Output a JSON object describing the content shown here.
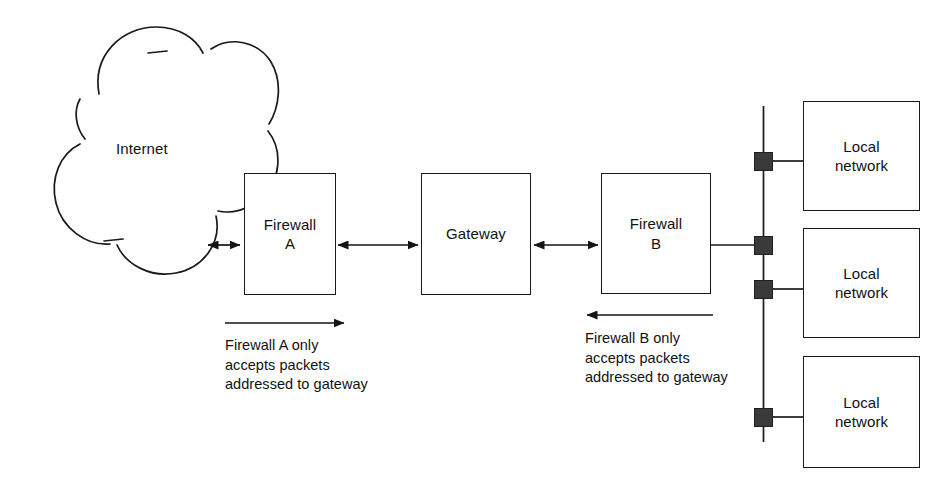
{
  "diagram": {
    "colors": {
      "stroke": "#1a1a1a",
      "background": "#ffffff",
      "tap_fill": "#3a3a3a",
      "text": "#111111"
    },
    "cloud": {
      "label": "Internet"
    },
    "nodes": [
      {
        "id": "firewall-a",
        "label": "Firewall\nA"
      },
      {
        "id": "gateway",
        "label": "Gateway"
      },
      {
        "id": "firewall-b",
        "label": "Firewall\nB"
      }
    ],
    "local_networks": [
      {
        "id": "local-network-1",
        "label": "Local\nnetwork"
      },
      {
        "id": "local-network-2",
        "label": "Local\nnetwork"
      },
      {
        "id": "local-network-3",
        "label": "Local\nnetwork"
      }
    ],
    "captions": [
      {
        "id": "caption-firewall-a",
        "direction": "right",
        "text": "Firewall A only\naccepts packets\naddressed to gateway"
      },
      {
        "id": "caption-firewall-b",
        "direction": "left",
        "text": "Firewall B only\naccepts packets\naddressed to gateway"
      }
    ],
    "links": [
      {
        "id": "link-internet-firewall-a",
        "type": "double-arrow"
      },
      {
        "id": "link-firewall-a-gateway",
        "type": "double-arrow"
      },
      {
        "id": "link-gateway-firewall-b",
        "type": "double-arrow"
      },
      {
        "id": "link-firewall-b-bus",
        "type": "line"
      }
    ]
  }
}
